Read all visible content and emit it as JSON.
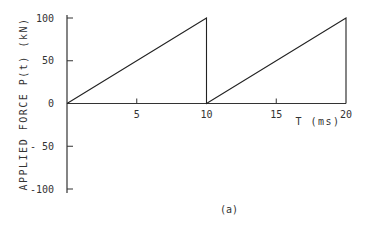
{
  "chart_data": {
    "type": "line",
    "title": "",
    "caption": "(a)",
    "xlabel": "T  (ms)",
    "ylabel": "APPLIED FORCE P(t)  (kN)",
    "xlim": [
      0,
      20
    ],
    "ylim": [
      -100,
      100
    ],
    "xticks": [
      5,
      10,
      15,
      20
    ],
    "yticks": [
      100,
      50,
      0,
      -50,
      -100
    ],
    "xtick_labels": [
      "5",
      "10",
      "15",
      "20"
    ],
    "ytick_labels": [
      "100",
      "50",
      "0",
      "- 50",
      "-100"
    ],
    "grid": false,
    "series": [
      {
        "name": "P(t)",
        "x": [
          0,
          10,
          10,
          20,
          20
        ],
        "y": [
          0,
          100,
          0,
          100,
          0
        ]
      }
    ]
  },
  "colors": {
    "line": "#222222",
    "axis": "#333333",
    "background": "#ffffff"
  }
}
